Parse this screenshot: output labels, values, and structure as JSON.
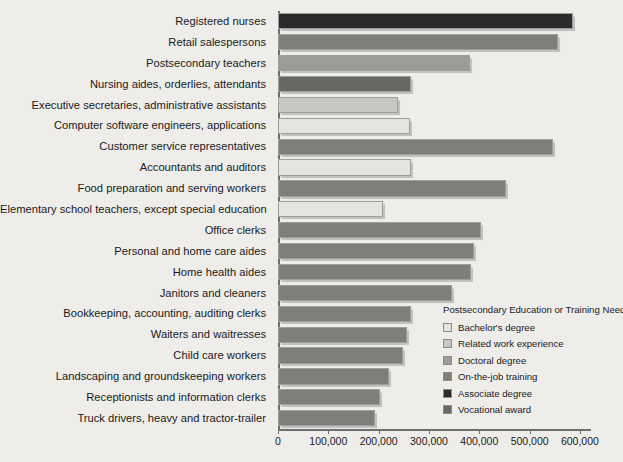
{
  "chart_data": {
    "type": "bar",
    "orientation": "horizontal",
    "title": "",
    "xlabel": "",
    "ylabel": "",
    "xlim": [
      0,
      620000
    ],
    "grid": false,
    "tick_labels": [
      "0",
      "100,000",
      "200,000",
      "300,000",
      "400,000",
      "500,000",
      "600,000"
    ],
    "tick_values": [
      0,
      100000,
      200000,
      300000,
      400000,
      500000,
      600000
    ],
    "categories": [
      "Registered nurses",
      "Retail salespersons",
      "Postsecondary teachers",
      "Nursing aides, orderlies, attendants",
      "Executive secretaries, administrative assistants",
      "Computer software engineers, applications",
      "Customer service representatives",
      "Accountants and auditors",
      "Food preparation and serving workers",
      "Elementary school teachers, except special education",
      "Office clerks",
      "Personal and home care aides",
      "Home health aides",
      "Janitors and cleaners",
      "Bookkeeping, accounting, auditing clerks",
      "Waiters and waitresses",
      "Child care workers",
      "Landscaping and groundskeeping workers",
      "Receptionists and information clerks",
      "Truck drivers, heavy and tractor-trailer"
    ],
    "values": [
      587000,
      557000,
      382000,
      264000,
      239000,
      262000,
      546000,
      264000,
      454000,
      209000,
      404000,
      389000,
      384000,
      345000,
      264000,
      257000,
      248000,
      221000,
      202000,
      193000
    ],
    "group_of_bar": [
      "Associate degree",
      "On-the-job training",
      "Doctoral degree",
      "Vocational award",
      "Related work experience",
      "Bachelor's degree",
      "On-the-job training",
      "Bachelor's degree",
      "On-the-job training",
      "Bachelor's degree",
      "On-the-job training",
      "On-the-job training",
      "On-the-job training",
      "On-the-job training",
      "On-the-job training",
      "On-the-job training",
      "On-the-job training",
      "On-the-job training",
      "On-the-job training",
      "On-the-job training"
    ],
    "legend": {
      "title": "Postsecondary Education or Training Needed",
      "position": "inside-bottom-right",
      "entries": [
        {
          "label": "Bachelor's degree",
          "color": "#e3e3e0"
        },
        {
          "label": "Related work experience",
          "color": "#c6c6c3"
        },
        {
          "label": "Doctoral degree",
          "color": "#9b9b98"
        },
        {
          "label": "On-the-job training",
          "color": "#7e7e7b"
        },
        {
          "label": "Associate degree",
          "color": "#2b2b2b"
        },
        {
          "label": "Vocational award",
          "color": "#676764"
        }
      ]
    },
    "colors": {
      "background": "#eeedea",
      "axis": "#6e6e6e",
      "text": "#1a1a1a",
      "bar_border": "#9d9d9d"
    }
  }
}
